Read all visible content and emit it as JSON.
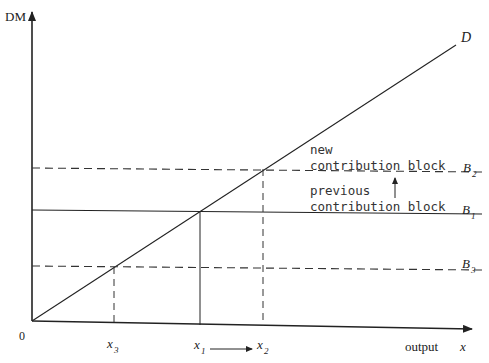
{
  "diagram": {
    "y_axis_label": "DM",
    "x_axis_label": "output",
    "x_axis_var": "x",
    "origin_label": "0",
    "demand_line_label": "D",
    "blocks": [
      {
        "id": "B2",
        "letter": "B",
        "sub": "2",
        "style": "dashed",
        "text_line1": "new",
        "text_line2": "contribution block"
      },
      {
        "id": "B1",
        "letter": "B",
        "sub": "1",
        "style": "solid",
        "text_line1": "previous",
        "text_line2": "contribution block"
      },
      {
        "id": "B3",
        "letter": "B",
        "sub": "3",
        "style": "dashed"
      }
    ],
    "x_ticks": [
      {
        "letter": "x",
        "sub": "3"
      },
      {
        "letter": "x",
        "sub": "1"
      },
      {
        "letter": "x",
        "sub": "2"
      }
    ],
    "colors": {
      "line": "#222222",
      "background": "#ffffff"
    }
  }
}
